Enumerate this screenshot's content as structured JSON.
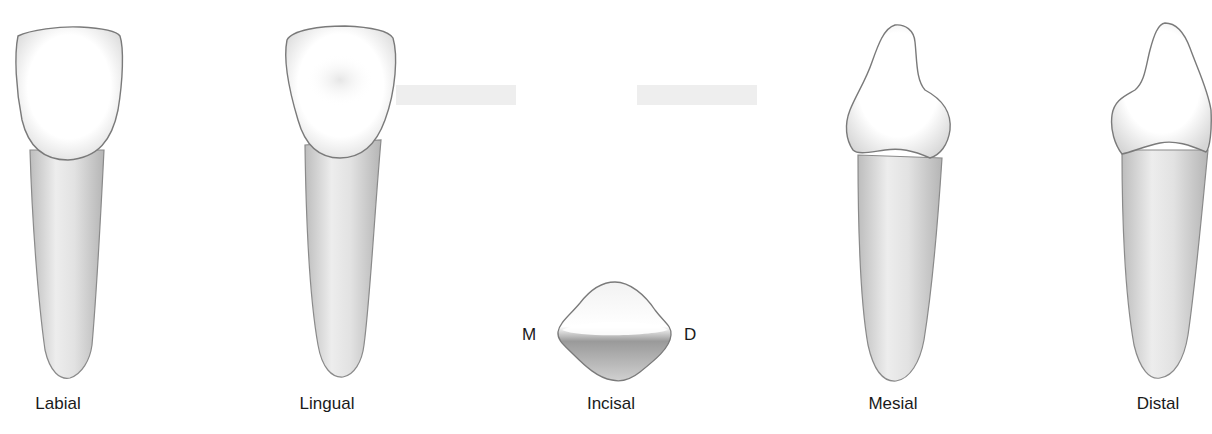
{
  "figure": {
    "views": [
      {
        "id": "labial",
        "label": "Labial",
        "center_x": 58
      },
      {
        "id": "lingual",
        "label": "Lingual",
        "center_x": 327
      },
      {
        "id": "incisal",
        "label": "Incisal",
        "center_x": 611
      },
      {
        "id": "mesial",
        "label": "Mesial",
        "center_x": 893
      },
      {
        "id": "distal",
        "label": "Distal",
        "center_x": 1158
      }
    ],
    "incisal_markers": {
      "mesial": "M",
      "distal": "D"
    },
    "colors": {
      "outline": "#6e6e6e",
      "crown": "#ffffff",
      "root": "#d9d9d9",
      "text": "#1a1a1a"
    }
  }
}
